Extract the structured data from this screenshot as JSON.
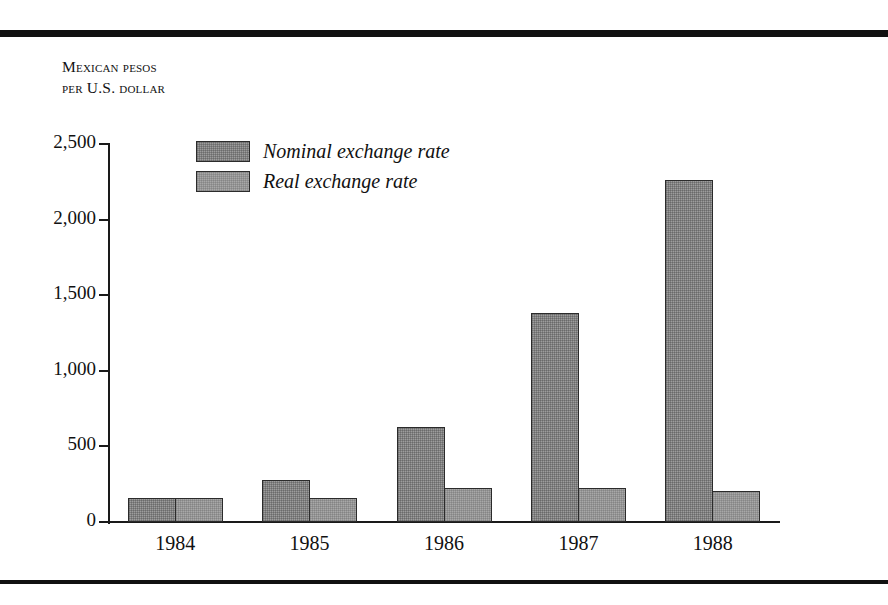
{
  "figure": {
    "axis_title_line1": "Mexican pesos",
    "axis_title_line2": "per U.S. dollar"
  },
  "legend": {
    "items": [
      {
        "label": "Nominal exchange rate",
        "swatch": "dark-gray-halftone-swatch",
        "color": "#9d9d9d"
      },
      {
        "label": "Real exchange rate",
        "swatch": "light-gray-halftone-swatch",
        "color": "#a8a8a8"
      }
    ]
  },
  "chart_data": {
    "type": "bar",
    "title": "",
    "subtitle": "",
    "xlabel": "",
    "ylabel": "Mexican pesos per U.S. dollar",
    "categories": [
      "1984",
      "1985",
      "1986",
      "1987",
      "1988"
    ],
    "series": [
      {
        "name": "Nominal exchange rate",
        "values": [
          160,
          280,
          630,
          1380,
          2260
        ]
      },
      {
        "name": "Real exchange rate",
        "values": [
          160,
          160,
          225,
          225,
          205
        ]
      }
    ],
    "ylim": [
      0,
      2500
    ],
    "ytick_values": [
      0,
      500,
      1000,
      1500,
      2000,
      2500
    ],
    "ytick_labels": [
      "0",
      "500",
      "1,000",
      "1,500",
      "2,000",
      "2,500"
    ],
    "grid": false,
    "legend_position": "top-left-inside",
    "annotations": []
  }
}
